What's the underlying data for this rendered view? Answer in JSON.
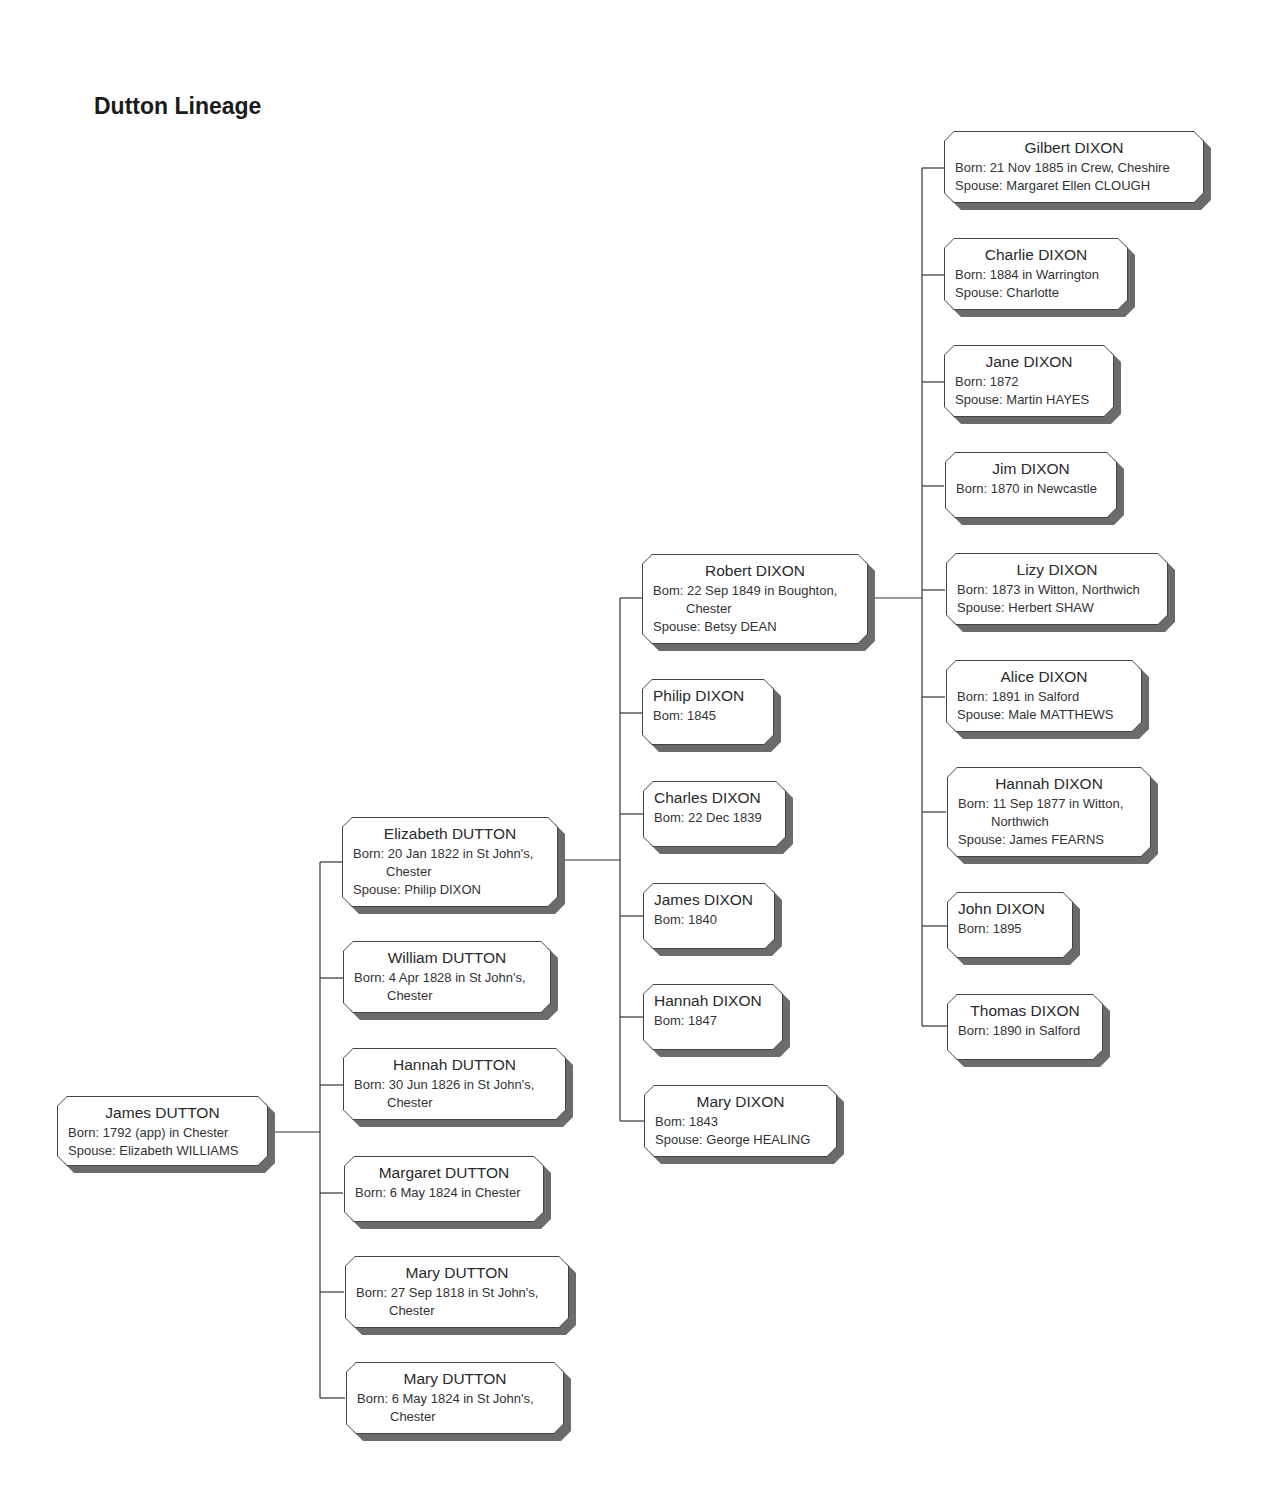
{
  "title": "Dutton Lineage",
  "nodes": {
    "james_dutton": {
      "name": "James DUTTON",
      "born": "Born: 1792 (app) in Chester",
      "spouse": "Spouse: Elizabeth WILLIAMS"
    },
    "elizabeth_dutton": {
      "name": "Elizabeth DUTTON",
      "born": "Born: 20 Jan 1822 in St John's,",
      "born_cont": "Chester",
      "spouse": "Spouse: Philip DIXON"
    },
    "william_dutton": {
      "name": "William DUTTON",
      "born": "Born: 4 Apr 1828 in St John's,",
      "born_cont": "Chester"
    },
    "hannah_dutton": {
      "name": "Hannah DUTTON",
      "born": "Born: 30 Jun 1826 in St  John's,",
      "born_cont": "Chester"
    },
    "margaret_dutton": {
      "name": "Margaret DUTTON",
      "born": "Born: 6 May 1824 in Chester"
    },
    "mary_dutton_1818": {
      "name": "Mary DUTTON",
      "born": "Born: 27 Sep 1818 in St  John's,",
      "born_cont": "Chester"
    },
    "mary_dutton_1824": {
      "name": "Mary DUTTON",
      "born": "Born: 6 May 1824 in St  John's,",
      "born_cont": "Chester"
    },
    "robert_dixon": {
      "name": "Robert DIXON",
      "born": "Bom: 22 Sep 1849 in Boughton,",
      "born_cont": "Chester",
      "spouse": "Spouse: Betsy DEAN"
    },
    "philip_dixon": {
      "name": "Philip DIXON",
      "born": "Bom: 1845"
    },
    "charles_dixon": {
      "name": "Charles DIXON",
      "born": "Bom: 22 Dec 1839"
    },
    "james_dixon": {
      "name": "James DIXON",
      "born": "Bom: 1840"
    },
    "hannah_dixon_1847": {
      "name": "Hannah DIXON",
      "born": "Bom: 1847"
    },
    "mary_dixon": {
      "name": "Mary DIXON",
      "born": "Bom: 1843",
      "spouse": "Spouse: George HEALING"
    },
    "gilbert_dixon": {
      "name": "Gilbert DIXON",
      "born": "Born: 21 Nov 1885 in Crew, Cheshire",
      "spouse": "Spouse: Margaret Ellen CLOUGH"
    },
    "charlie_dixon": {
      "name": "Charlie DIXON",
      "born": "Born: 1884 in Warrington",
      "spouse": "Spouse: Charlotte"
    },
    "jane_dixon": {
      "name": "Jane DIXON",
      "born": "Born: 1872",
      "spouse": "Spouse: Martin HAYES"
    },
    "jim_dixon": {
      "name": "Jim DIXON",
      "born": "Born: 1870 in Newcastle"
    },
    "lizy_dixon": {
      "name": "Lizy DIXON",
      "born": "Born: 1873 in Witton, Northwich",
      "spouse": "Spouse: Herbert SHAW"
    },
    "alice_dixon": {
      "name": "Alice DIXON",
      "born": "Born: 1891 in Salford",
      "spouse": "Spouse: Male MATTHEWS"
    },
    "hannah_dixon_1877": {
      "name": "Hannah DIXON",
      "born": "Born: 11 Sep 1877 in Witton,",
      "born_cont": "Northwich",
      "spouse": "Spouse: James FEARNS"
    },
    "john_dixon": {
      "name": "John DIXON",
      "born": "Born: 1895"
    },
    "thomas_dixon": {
      "name": "Thomas DIXON",
      "born": "Born: 1890 in Salford"
    }
  },
  "colors": {
    "line": "#333333",
    "shadow": "#6b6b6b",
    "box_fill": "#ffffff",
    "text": "#2a2a2a"
  }
}
